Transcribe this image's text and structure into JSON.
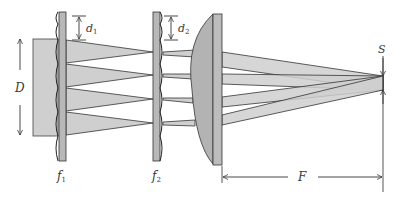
{
  "diagram": {
    "colors": {
      "beam_fill": "#c9c9c9",
      "lens_fill": "#b3b3b3",
      "stroke": "#333333",
      "background": "#ffffff"
    },
    "labels": {
      "beam_width": "D",
      "pitch_1": "d",
      "pitch_1_sub": "1",
      "pitch_2": "d",
      "pitch_2_sub": "2",
      "focal_1": "f",
      "focal_1_sub": "1",
      "focal_2": "f",
      "focal_2_sub": "2",
      "condenser_focal": "F",
      "spot_size": "S"
    },
    "elements": [
      {
        "id": "input-beam",
        "label": "D"
      },
      {
        "id": "lens-array-1",
        "label": "f1",
        "pitch": "d1"
      },
      {
        "id": "lens-array-2",
        "label": "f2",
        "pitch": "d2"
      },
      {
        "id": "condenser-lens",
        "label": "F"
      },
      {
        "id": "focal-plane",
        "label": "S"
      }
    ]
  }
}
